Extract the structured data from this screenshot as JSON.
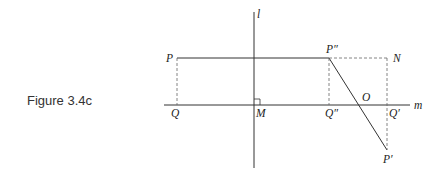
{
  "caption": "Figure 3.4c",
  "colors": {
    "line": "#333333",
    "dashed": "#666666",
    "text": "#222222"
  },
  "labels": {
    "l": "l",
    "m": "m",
    "P": "P",
    "P2": "P″",
    "N": "N",
    "Q": "Q",
    "M": "M",
    "Q2": "Q″",
    "O": "O",
    "Q1": "Q′",
    "P1": "P′"
  },
  "points": {
    "P": [
      177,
      58
    ],
    "P2": [
      329,
      58
    ],
    "N": [
      387,
      58
    ],
    "Q": [
      177,
      105
    ],
    "M": [
      254,
      105
    ],
    "Q2": [
      329,
      105
    ],
    "O": [
      357,
      105
    ],
    "Q1": [
      387,
      105
    ],
    "P1": [
      387,
      150
    ]
  }
}
